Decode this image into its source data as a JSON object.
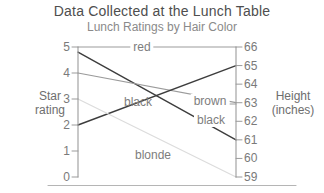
{
  "chart_data": {
    "type": "line",
    "chart_style": "slopegraph",
    "title": "Data Collected at the Lunch Table",
    "subtitle": "Lunch Ratings by Hair Color",
    "grid": false,
    "legend": "none (lines labeled inline)",
    "axis_color": "#9b9b9b",
    "label_color": "#7d7d7d",
    "left_axis": {
      "title": "Star rating",
      "title_lines": [
        "Star",
        "rating"
      ],
      "ticks": [
        "5",
        "4",
        "3",
        "2",
        "1",
        "0"
      ],
      "ylim": [
        0,
        5
      ]
    },
    "right_axis": {
      "title": "Height (inches)",
      "title_lines": [
        "Height",
        "(inches)"
      ],
      "ticks": [
        "66",
        "65",
        "64",
        "63",
        "62",
        "61",
        "60",
        "59"
      ],
      "ylim": [
        59,
        66
      ]
    },
    "series": [
      {
        "label": "red",
        "star_rating": 5,
        "height_inches": 66,
        "color": "#9b9b9b"
      },
      {
        "label": "black",
        "star_rating": 4.8,
        "height_inches": 61,
        "color": "#3d3d3d"
      },
      {
        "label": "brown",
        "star_rating": 4,
        "height_inches": 63,
        "color": "#9b9b9b"
      },
      {
        "label": "black",
        "star_rating": 2,
        "height_inches": 65,
        "color": "#3d3d3d"
      },
      {
        "label": "blonde",
        "star_rating": 3,
        "height_inches": 59,
        "color": "#dcdcdc"
      }
    ]
  }
}
